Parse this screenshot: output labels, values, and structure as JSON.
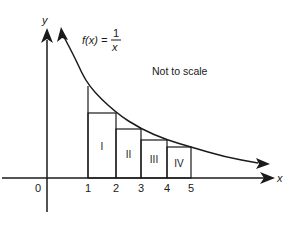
{
  "diagram": {
    "function_label": "f(x) =",
    "fraction_numerator": "1",
    "fraction_denominator": "x",
    "note": "Not to scale",
    "axis_x_label": "x",
    "axis_y_label": "y",
    "origin_label": "0",
    "x_ticks": [
      "1",
      "2",
      "3",
      "4",
      "5"
    ],
    "rectangles": [
      {
        "label": "I",
        "x_from": 1,
        "x_to": 2,
        "height_at": 2
      },
      {
        "label": "II",
        "x_from": 2,
        "x_to": 3,
        "height_at": 3
      },
      {
        "label": "III",
        "x_from": 3,
        "x_to": 4,
        "height_at": 4
      },
      {
        "label": "IV",
        "x_from": 4,
        "x_to": 5,
        "height_at": 5
      }
    ],
    "function": "1/x",
    "colors": {
      "ink": "#1a1a1a",
      "background": "#ffffff"
    }
  }
}
